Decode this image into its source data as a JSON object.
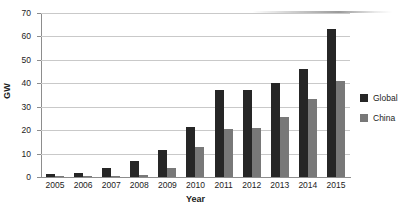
{
  "chart_data": {
    "type": "bar",
    "title": "",
    "xlabel": "Year",
    "ylabel": "GW",
    "categories": [
      "2005",
      "2006",
      "2007",
      "2008",
      "2009",
      "2010",
      "2011",
      "2012",
      "2013",
      "2014",
      "2015"
    ],
    "series": [
      {
        "name": "Global",
        "color": "#262626",
        "values": [
          1.3,
          1.8,
          3.8,
          7.0,
          11.4,
          21.5,
          37.0,
          37.0,
          40.0,
          46.0,
          63.0
        ]
      },
      {
        "name": "China",
        "color": "#787878",
        "values": [
          0.1,
          0.2,
          0.5,
          1.0,
          4.0,
          13.0,
          20.5,
          21.0,
          25.5,
          33.5,
          41.0
        ]
      }
    ],
    "ylim": [
      0,
      70
    ],
    "yticks": [
      0,
      10,
      20,
      30,
      40,
      50,
      60,
      70
    ],
    "grid": true,
    "legend_position": "right"
  },
  "legend": {
    "items": [
      {
        "label": "Global"
      },
      {
        "label": "China"
      }
    ]
  }
}
